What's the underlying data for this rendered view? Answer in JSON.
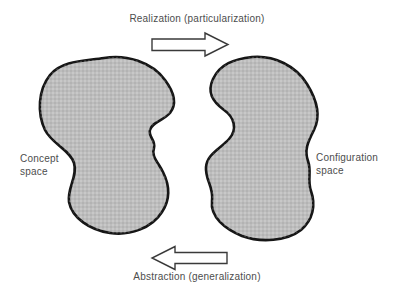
{
  "diagram": {
    "top_label": "Realization (particularization)",
    "bottom_label": "Abstraction (generalization)",
    "concept_label": "Concept space",
    "configuration_label": "Configuration space",
    "colors": {
      "background": "#ffffff",
      "blob_fill": "#bdbdbd",
      "blob_stroke": "#161616",
      "arrow_fill": "#ffffff",
      "arrow_stroke": "#3a3a3a",
      "text": "#4d4d4d"
    }
  }
}
